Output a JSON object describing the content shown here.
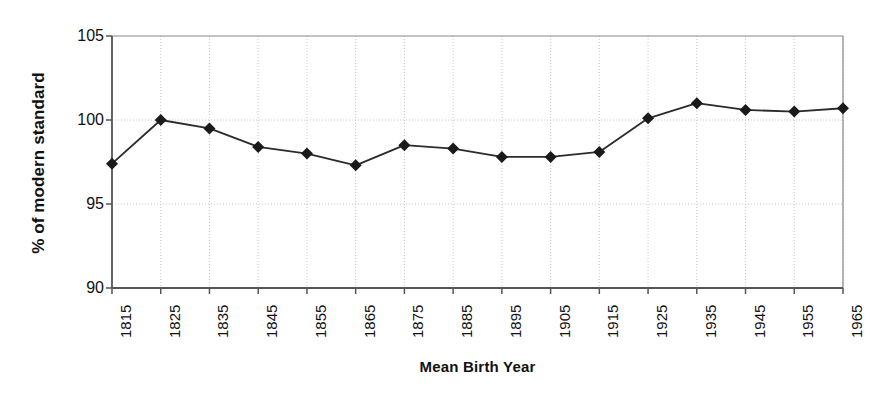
{
  "chart_data": {
    "type": "line",
    "title": "",
    "subtitle": "",
    "xlabel": "Mean Birth Year",
    "ylabel": "% of modern standard",
    "categories": [
      "1815",
      "1825",
      "1835",
      "1845",
      "1855",
      "1865",
      "1875",
      "1885",
      "1895",
      "1905",
      "1915",
      "1925",
      "1935",
      "1945",
      "1955",
      "1965"
    ],
    "values": [
      97.4,
      100.0,
      99.5,
      98.4,
      98.0,
      97.3,
      98.5,
      98.3,
      97.8,
      97.8,
      98.1,
      100.1,
      101.0,
      100.6,
      100.5,
      100.7
    ],
    "series": [
      {
        "name": "% of modern standard",
        "values": [
          97.4,
          100.0,
          99.5,
          98.4,
          98.0,
          97.3,
          98.5,
          98.3,
          97.8,
          97.8,
          98.1,
          100.1,
          101.0,
          100.6,
          100.5,
          100.7
        ]
      }
    ],
    "ylim": [
      90,
      105
    ],
    "yticks": [
      90,
      95,
      100,
      105
    ],
    "ytick_labels": [
      "90",
      "95",
      "100",
      "105"
    ],
    "xlim": [
      "1815",
      "1965"
    ],
    "grid": {
      "horizontal": true,
      "vertical": true,
      "style": "dotted",
      "color": "#c8c8c8"
    },
    "legend": {
      "visible": false,
      "position": "none"
    },
    "marker": {
      "shape": "diamond",
      "color": "#1a1a1a",
      "size": 9
    },
    "line": {
      "color": "#2b2b2b",
      "width": 1.8
    },
    "axis_color": "#555555",
    "background": "#ffffff"
  }
}
